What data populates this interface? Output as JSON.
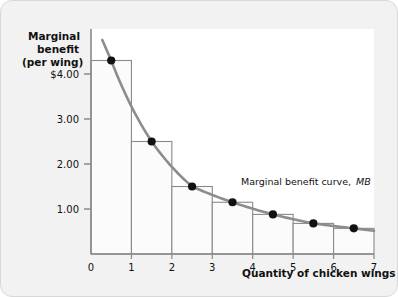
{
  "figure": {
    "background_color": "#f2f2f2",
    "plot_background_color": "#ffffff",
    "border_color": "#d8d8d8"
  },
  "chart_data": {
    "type": "bar",
    "title": "",
    "subtitle": "",
    "xlabel": "Quantity of chicken wings",
    "ylabel": "Marginal benefit (per wing)",
    "ylabel_lines": [
      "Marginal",
      "benefit",
      "(per wing)"
    ],
    "categories": [
      1,
      2,
      3,
      4,
      5,
      6,
      7
    ],
    "values": [
      4.3,
      2.5,
      1.5,
      1.15,
      0.88,
      0.68,
      0.57
    ],
    "bar_fill_color": "#fbfbfb",
    "bar_edge_color": "#8a8a8a",
    "xlim": [
      0,
      7
    ],
    "ylim": [
      0,
      5.0
    ],
    "xticks": [
      "0",
      "1",
      "2",
      "3",
      "4",
      "5",
      "6",
      "7"
    ],
    "yticks": [
      "$4.00",
      "3.00",
      "2.00",
      "1.00"
    ],
    "ytick_values": [
      4,
      3,
      2,
      1
    ],
    "grid": false,
    "legend_position": "inline-annotation",
    "series": [
      {
        "name": "Marginal benefit curve, MB",
        "type": "line",
        "color": "#8c8c8c",
        "marker": "filled-circle",
        "marker_color": "#111111",
        "x": [
          0.5,
          1.5,
          2.5,
          3.5,
          4.5,
          5.5,
          6.5
        ],
        "values": [
          4.3,
          2.5,
          1.5,
          1.15,
          0.88,
          0.68,
          0.57
        ]
      }
    ],
    "annotations": [
      {
        "text": "Marginal benefit curve,",
        "emphasis_text": "MB",
        "x": 4.0,
        "y": 1.32
      }
    ]
  }
}
